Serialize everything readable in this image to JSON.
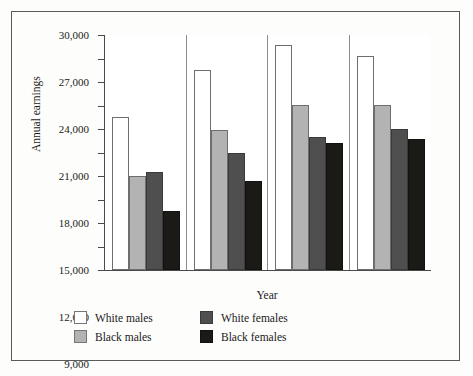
{
  "chart_data": {
    "type": "bar",
    "title": "",
    "subtitle": "",
    "xlabel": "Year",
    "ylabel": "Annual earnings",
    "categories": [
      "1957",
      "1967",
      "1977",
      "1987"
    ],
    "series": [
      {
        "name": "White males",
        "color": "#ffffff",
        "values": [
          19500,
          25500,
          28700,
          27300
        ]
      },
      {
        "name": "Black males",
        "color": "#b3b3b3",
        "values": [
          12000,
          17900,
          21100,
          21100
        ]
      },
      {
        "name": "White females",
        "color": "#4f4f4f",
        "values": [
          12500,
          15000,
          17000,
          18000
        ]
      },
      {
        "name": "Black females",
        "color": "#1c1a17",
        "values": [
          7500,
          11300,
          16200,
          16700
        ]
      }
    ],
    "ylim": [
      0,
      30000
    ],
    "yticks": [
      0,
      3000,
      6000,
      9000,
      12000,
      15000,
      18000,
      21000,
      24000,
      27000,
      30000
    ],
    "ytick_labels": [
      "0",
      "3,000",
      "6,000",
      "9,000",
      "12,000",
      "15,000",
      "18,000",
      "21,000",
      "24,000",
      "27,000",
      "30,000"
    ],
    "grid": false,
    "legend_position": "bottom"
  },
  "legend": {
    "entries": [
      {
        "label": "White males"
      },
      {
        "label": "Black males"
      },
      {
        "label": "White females"
      },
      {
        "label": "Black females"
      }
    ]
  }
}
